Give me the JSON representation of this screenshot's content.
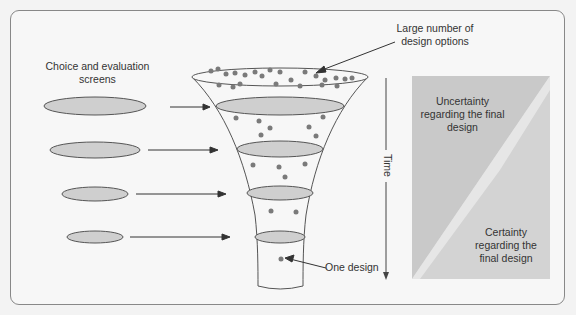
{
  "diagram": {
    "labels": {
      "choice_screens": "Choice and evaluation screens",
      "design_options": "Large number of design options",
      "one_design": "One design",
      "time": "Time",
      "uncertainty": "Uncertainty regarding the final design",
      "certainty": "Certainty regarding the final design"
    },
    "screens": [
      {
        "cx": 95,
        "cy": 106,
        "rx": 50,
        "ry": 9
      },
      {
        "cx": 95,
        "cy": 150,
        "rx": 45,
        "ry": 8
      },
      {
        "cx": 95,
        "cy": 194,
        "rx": 34,
        "ry": 7
      },
      {
        "cx": 95,
        "cy": 237,
        "rx": 28,
        "ry": 6
      }
    ],
    "colors": {
      "ellipse_fill": "#cfcfcf",
      "dot": "#7a7a7a",
      "uncertainty_fill": "#c8c8c8",
      "certainty_fill": "#dcdcdc",
      "line": "#444444"
    }
  }
}
